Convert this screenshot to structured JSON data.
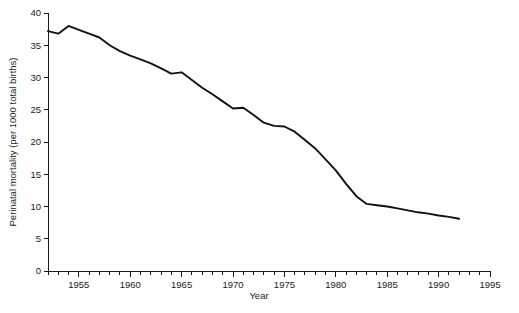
{
  "chart_data": {
    "type": "line",
    "title": "",
    "xlabel": "Year",
    "ylabel": "Perinatal mortality (per 1000 total births)",
    "xlim": [
      1952,
      1995
    ],
    "ylim": [
      0,
      40
    ],
    "grid": false,
    "legend": null,
    "x_major_ticks": [
      1955,
      1960,
      1965,
      1970,
      1975,
      1980,
      1985,
      1990,
      1995
    ],
    "x_major_tick_labels": [
      "1955",
      "1960",
      "1965",
      "1970",
      "1975",
      "1980",
      "1985",
      "1990",
      "1995"
    ],
    "x_minor_tick_interval": 1,
    "y_major_ticks": [
      0,
      5,
      10,
      15,
      20,
      25,
      30,
      35,
      40
    ],
    "y_major_tick_labels": [
      "0",
      "5",
      "10",
      "15",
      "20",
      "25",
      "30",
      "35",
      "40"
    ],
    "series": [
      {
        "name": "Perinatal mortality",
        "color": "#111111",
        "x": [
          1952,
          1953,
          1954,
          1955,
          1956,
          1957,
          1958,
          1959,
          1960,
          1961,
          1962,
          1963,
          1964,
          1965,
          1966,
          1967,
          1968,
          1969,
          1970,
          1971,
          1972,
          1973,
          1974,
          1975,
          1976,
          1977,
          1978,
          1979,
          1980,
          1981,
          1982,
          1983,
          1984,
          1985,
          1986,
          1987,
          1988,
          1989,
          1990,
          1991,
          1992
        ],
        "values": [
          37.2,
          36.8,
          38.0,
          37.4,
          36.8,
          36.2,
          35.0,
          34.1,
          33.4,
          32.8,
          32.2,
          31.4,
          30.6,
          30.8,
          29.6,
          28.4,
          27.4,
          26.3,
          25.2,
          25.3,
          24.2,
          23.0,
          22.5,
          22.4,
          21.6,
          20.3,
          19.0,
          17.3,
          15.6,
          13.5,
          11.6,
          10.4,
          10.2,
          10.0,
          9.7,
          9.4,
          9.1,
          8.9,
          8.6,
          8.4,
          8.1
        ]
      }
    ]
  }
}
